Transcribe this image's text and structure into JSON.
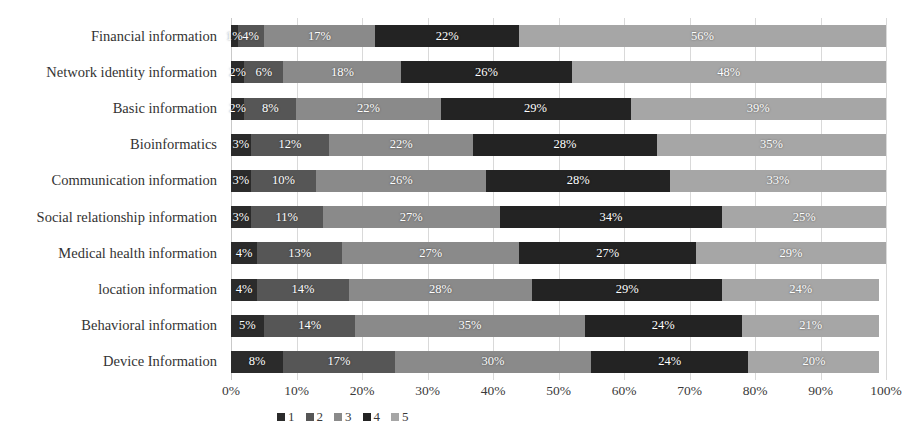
{
  "chart_data": {
    "type": "bar",
    "orientation": "horizontal",
    "stacked": true,
    "stack_mode": "percent",
    "title": "",
    "xlabel": "",
    "ylabel": "",
    "xlim": [
      0,
      100
    ],
    "grid": true,
    "legend_position": "bottom",
    "xticks": [
      "0%",
      "10%",
      "20%",
      "30%",
      "40%",
      "50%",
      "60%",
      "70%",
      "80%",
      "90%",
      "100%"
    ],
    "xtick_values": [
      0,
      10,
      20,
      30,
      40,
      50,
      60,
      70,
      80,
      90,
      100
    ],
    "categories": [
      "Financial information",
      "Network identity information",
      "Basic information",
      "Bioinformatics",
      "Communication information",
      "Social relationship information",
      "Medical health information",
      "location information",
      "Behavioral information",
      "Device Information"
    ],
    "series": [
      {
        "name": "1",
        "color": "#2b2b2b",
        "values": [
          1,
          2,
          2,
          3,
          3,
          3,
          4,
          4,
          5,
          8
        ]
      },
      {
        "name": "2",
        "color": "#565656",
        "values": [
          4,
          6,
          8,
          12,
          10,
          11,
          13,
          14,
          14,
          17
        ]
      },
      {
        "name": "3",
        "color": "#8a8a8a",
        "values": [
          17,
          18,
          22,
          22,
          26,
          27,
          27,
          28,
          35,
          30
        ]
      },
      {
        "name": "4",
        "color": "#232323",
        "values": [
          22,
          26,
          29,
          28,
          28,
          34,
          27,
          29,
          24,
          24
        ]
      },
      {
        "name": "5",
        "color": "#a6a6a6",
        "values": [
          56,
          48,
          39,
          35,
          33,
          25,
          29,
          24,
          21,
          20
        ]
      }
    ],
    "value_labels": [
      [
        "1%",
        "4%",
        "17%",
        "22%",
        "56%"
      ],
      [
        "2%",
        "6%",
        "18%",
        "26%",
        "48%"
      ],
      [
        "2%",
        "8%",
        "22%",
        "29%",
        "39%"
      ],
      [
        "3%",
        "12%",
        "22%",
        "28%",
        "35%"
      ],
      [
        "3%",
        "10%",
        "26%",
        "28%",
        "33%"
      ],
      [
        "3%",
        "11%",
        "27%",
        "34%",
        "25%"
      ],
      [
        "4%",
        "13%",
        "27%",
        "27%",
        "29%"
      ],
      [
        "4%",
        "14%",
        "28%",
        "29%",
        "24%"
      ],
      [
        "5%",
        "14%",
        "35%",
        "24%",
        "21%"
      ],
      [
        "8%",
        "17%",
        "30%",
        "24%",
        "20%"
      ]
    ]
  }
}
